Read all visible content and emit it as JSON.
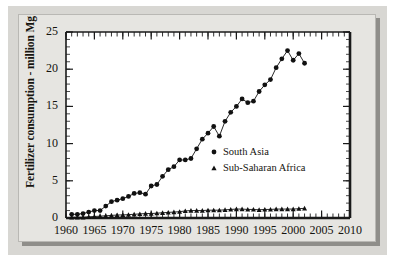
{
  "figure": {
    "background_color": "#e6e5e1",
    "page_color": "#d8d7d3",
    "axis_color": "#1a1a1a",
    "marker_color": "#111111"
  },
  "chart_data": {
    "type": "line",
    "title": "",
    "subtitle": "",
    "xlabel": "",
    "ylabel": "Fertilizer consumption - million Mg",
    "xlim": [
      1960,
      2010
    ],
    "ylim": [
      0,
      25
    ],
    "xticks": [
      1960,
      1965,
      1970,
      1975,
      1980,
      1985,
      1990,
      1995,
      2000,
      2005,
      2010
    ],
    "xtick_labels": [
      "1960",
      "1965",
      "1970",
      "1975",
      "1980",
      "1985",
      "1990",
      "1995",
      "2000",
      "2005",
      "2010"
    ],
    "yticks": [
      0,
      5,
      10,
      15,
      20,
      25
    ],
    "ytick_labels": [
      "0",
      "5",
      "10",
      "15",
      "20",
      "25"
    ],
    "minor_ticks_x": 1,
    "minor_ticks_y": 1,
    "grid": false,
    "legend_position": "center-right-inside",
    "series": [
      {
        "name": "South Asia",
        "marker": "circle",
        "x": [
          1961,
          1962,
          1963,
          1964,
          1965,
          1966,
          1967,
          1968,
          1969,
          1970,
          1971,
          1972,
          1973,
          1974,
          1975,
          1976,
          1977,
          1978,
          1979,
          1980,
          1981,
          1982,
          1983,
          1984,
          1985,
          1986,
          1987,
          1988,
          1989,
          1990,
          1991,
          1992,
          1993,
          1994,
          1995,
          1996,
          1997,
          1998,
          1999,
          2000,
          2001,
          2002
        ],
        "values": [
          0.5,
          0.5,
          0.6,
          0.8,
          1.0,
          1.0,
          1.6,
          2.2,
          2.4,
          2.6,
          2.9,
          3.3,
          3.4,
          3.2,
          4.3,
          4.5,
          5.6,
          6.5,
          6.9,
          7.8,
          7.8,
          8.0,
          9.3,
          10.6,
          11.4,
          12.3,
          11.0,
          13.0,
          14.2,
          15.0,
          16.0,
          15.5,
          15.7,
          17.0,
          17.9,
          18.6,
          20.2,
          21.4,
          22.5,
          21.2,
          22.1,
          20.8
        ]
      },
      {
        "name": "Sub-Saharan Africa",
        "marker": "triangle",
        "x": [
          1961,
          1962,
          1963,
          1964,
          1965,
          1966,
          1967,
          1968,
          1969,
          1970,
          1971,
          1972,
          1973,
          1974,
          1975,
          1976,
          1977,
          1978,
          1979,
          1980,
          1981,
          1982,
          1983,
          1984,
          1985,
          1986,
          1987,
          1988,
          1989,
          1990,
          1991,
          1992,
          1993,
          1994,
          1995,
          1996,
          1997,
          1998,
          1999,
          2000,
          2001,
          2002
        ],
        "values": [
          0.1,
          0.1,
          0.1,
          0.15,
          0.2,
          0.25,
          0.3,
          0.35,
          0.4,
          0.42,
          0.45,
          0.5,
          0.55,
          0.6,
          0.6,
          0.65,
          0.7,
          0.75,
          0.8,
          0.85,
          0.95,
          1.0,
          1.0,
          1.0,
          1.05,
          1.05,
          1.05,
          1.1,
          1.15,
          1.2,
          1.2,
          1.15,
          1.15,
          1.1,
          1.15,
          1.15,
          1.2,
          1.2,
          1.2,
          1.2,
          1.25,
          1.3
        ]
      }
    ]
  },
  "legend": {
    "items": [
      {
        "label": "South Asia",
        "marker": "circle"
      },
      {
        "label": "Sub-Saharan Africa",
        "marker": "triangle"
      }
    ]
  }
}
